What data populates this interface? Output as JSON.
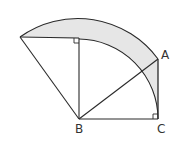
{
  "diagram": {
    "type": "geometry",
    "colors": {
      "stroke": "#2a2a2a",
      "shade": "#e6e6e6",
      "background": "#ffffff",
      "label": "#333333"
    },
    "points": {
      "A": {
        "label": "A",
        "x": 158,
        "y": 59
      },
      "B": {
        "label": "B",
        "x": 79,
        "y": 119
      },
      "C": {
        "label": "C",
        "x": 158,
        "y": 119
      },
      "D": {
        "label": "",
        "x": 20,
        "y": 37
      },
      "E": {
        "label": "",
        "x": 79,
        "y": 38
      }
    },
    "labels": {
      "A": "A",
      "B": "B",
      "C": "C"
    },
    "right_angles": [
      "E",
      "C"
    ]
  }
}
